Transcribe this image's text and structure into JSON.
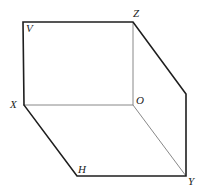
{
  "diagram": {
    "points": {
      "V": {
        "x": 23,
        "y": 22
      },
      "Z": {
        "x": 133,
        "y": 22
      },
      "R": {
        "x": 186,
        "y": 94
      },
      "X": {
        "x": 24,
        "y": 105
      },
      "O": {
        "x": 133,
        "y": 105
      },
      "H": {
        "x": 77,
        "y": 176
      },
      "Y": {
        "x": 186,
        "y": 176
      }
    },
    "labels": {
      "V": "V",
      "Z": "Z",
      "X": "X",
      "O": "O",
      "H": "H",
      "Y": "Y"
    },
    "colors": {
      "thick_line": "#1e1e1e",
      "thin_line": "#6a6a6a",
      "label": "#222222",
      "background": "#ffffff"
    }
  }
}
